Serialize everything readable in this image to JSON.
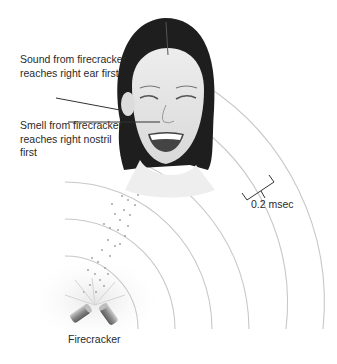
{
  "figure": {
    "title": "",
    "labels": {
      "sound": "Sound from firecracker reaches right ear first",
      "smell": "Smell from firecracker reaches right nostril first",
      "interval": "0.2 msec",
      "source": "Firecracker"
    },
    "wavefronts": {
      "center": [
        65,
        329
      ],
      "radii": [
        73,
        110,
        147,
        184,
        221,
        258
      ],
      "spacing_label": "0.2 msec"
    },
    "colors": {
      "background": "#ffffff",
      "text": "#2a2a2a",
      "wave": "#c8c8c8",
      "leader": "#333333",
      "hair": "#1e1e1e",
      "skin": "#e6e6e6"
    }
  }
}
